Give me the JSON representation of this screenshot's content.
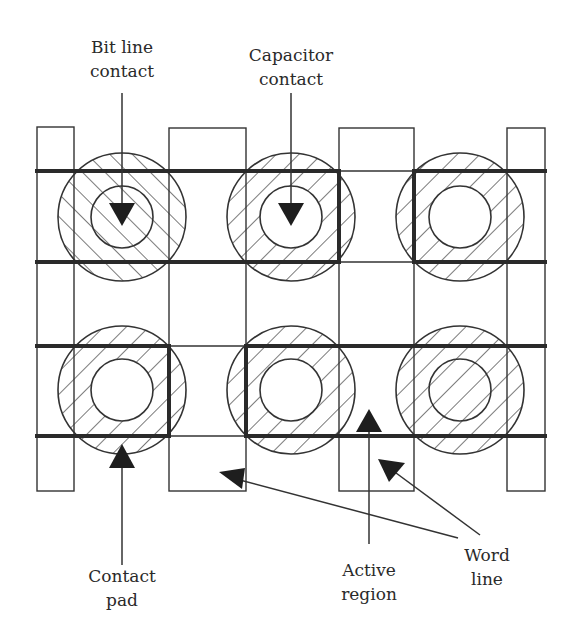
{
  "figure": {
    "colors": {
      "ink": "#2a2a2a",
      "background": "#ffffff"
    }
  },
  "labels": {
    "bit_line_contact": {
      "line1": "Bit line",
      "line2": "contact"
    },
    "capacitor_contact": {
      "line1": "Capacitor",
      "line2": "contact"
    },
    "contact_pad": {
      "line1": "Contact",
      "line2": "pad"
    },
    "active_region": {
      "line1": "Active",
      "line2": "region"
    },
    "word_line": {
      "line1": "Word",
      "line2": "line"
    }
  },
  "layout": {
    "columns": [
      {
        "name": "column-1",
        "x1": 37,
        "x2": 74
      },
      {
        "name": "column-2",
        "x1": 169,
        "x2": 246
      },
      {
        "name": "column-3",
        "x1": 339,
        "x2": 414
      },
      {
        "name": "column-4",
        "x1": 507,
        "x2": 545
      }
    ],
    "word_lines_y": [
      171,
      262,
      346,
      436
    ],
    "column_top": 127,
    "column_bottom": 491,
    "contacts": [
      {
        "row": 1,
        "col": 1,
        "cx": 122,
        "cy": 217,
        "hatch": "backslash",
        "inner_hatched": true
      },
      {
        "row": 1,
        "col": 2,
        "cx": 291,
        "cy": 217,
        "hatch": "slash",
        "inner_hatched": false
      },
      {
        "row": 1,
        "col": 3,
        "cx": 460,
        "cy": 217,
        "hatch": "slash",
        "inner_hatched": false
      },
      {
        "row": 2,
        "col": 1,
        "cx": 122,
        "cy": 390,
        "hatch": "slash",
        "inner_hatched": false
      },
      {
        "row": 2,
        "col": 2,
        "cx": 291,
        "cy": 390,
        "hatch": "slash",
        "inner_hatched": false
      },
      {
        "row": 2,
        "col": 3,
        "cx": 460,
        "cy": 390,
        "hatch": "slash",
        "inner_hatched": true
      }
    ],
    "outer_radius": 64,
    "inner_radius": 31
  }
}
